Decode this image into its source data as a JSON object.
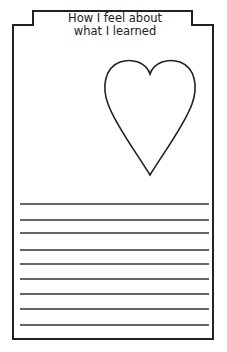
{
  "worksheet": {
    "title_line1": "How I feel about",
    "title_line2": "what I learned",
    "heart_icon": "heart-outline",
    "writing_lines_count": 9,
    "ink_color": "#222222"
  }
}
